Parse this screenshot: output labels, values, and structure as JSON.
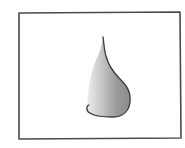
{
  "image": {
    "subject": "pencil sketch of a nose in profile",
    "frame_color": "#4a4a4a",
    "sketch_outline_color": "#3a3a3a",
    "shade_dark": "#8a8a8a",
    "shade_light": "#e8e8e8",
    "background": "#ffffff"
  }
}
